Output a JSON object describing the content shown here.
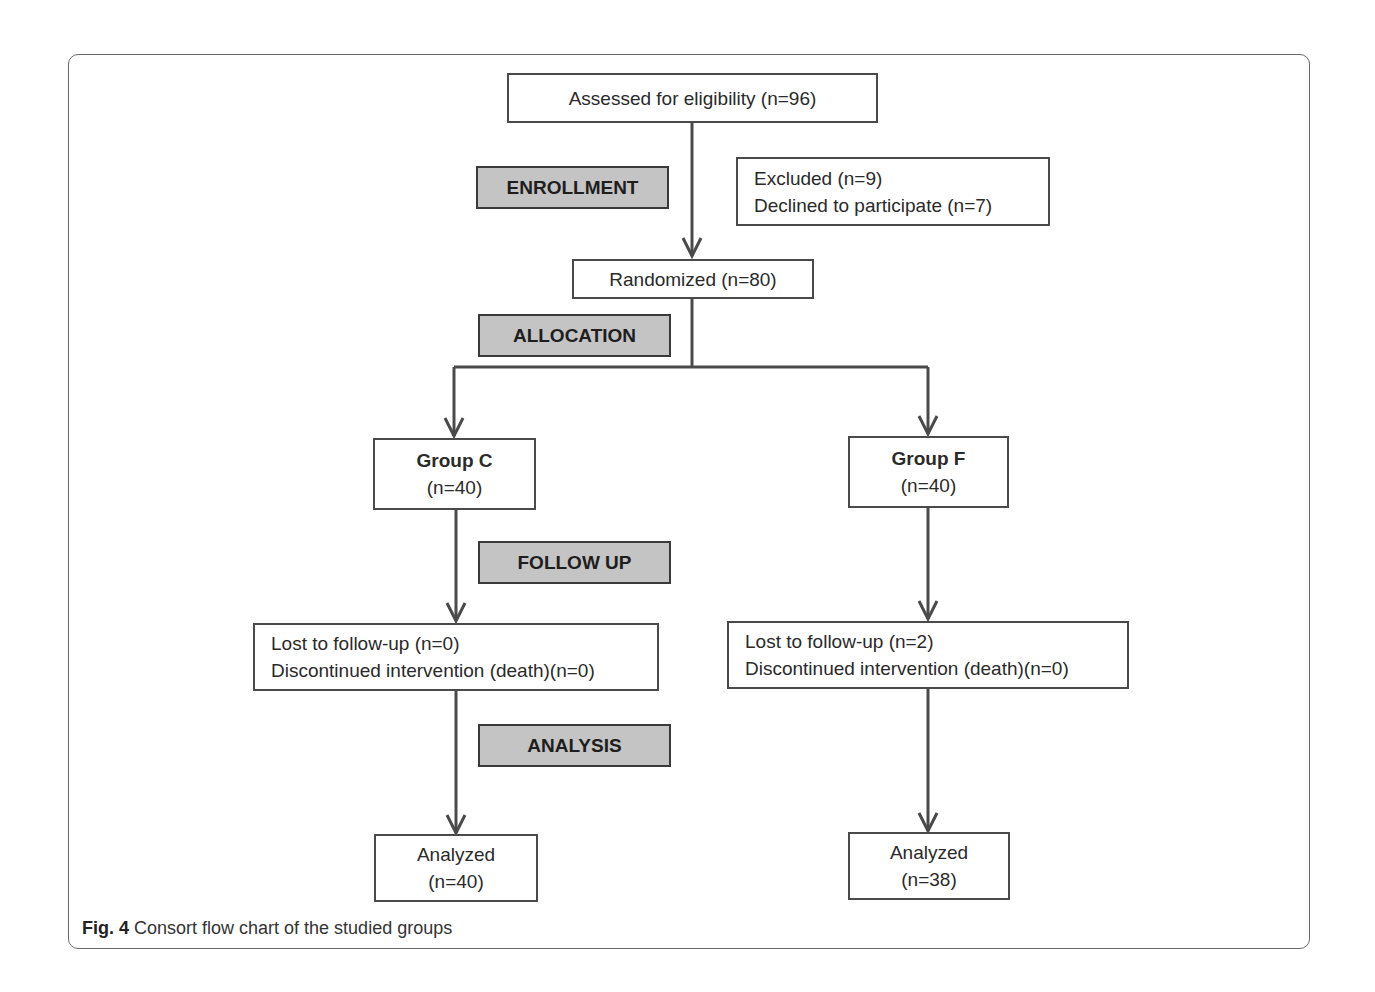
{
  "diagram": {
    "type": "CONSORT flow chart",
    "stages": {
      "enrollment": "ENROLLMENT",
      "allocation": "ALLOCATION",
      "follow_up": "FOLLOW UP",
      "analysis": "ANALYSIS"
    },
    "nodes": {
      "assessed": "Assessed for eligibility (n=96)",
      "excluded": {
        "line1": "Excluded (n=9)",
        "line2": "Declined to participate (n=7)"
      },
      "randomized": "Randomized (n=80)",
      "group_c": {
        "title": "Group C",
        "n": "(n=40)"
      },
      "group_f": {
        "title": "Group F",
        "n": "(n=40)"
      },
      "followup_c": {
        "line1": "Lost to follow-up (n=0)",
        "line2": "Discontinued intervention (death)(n=0)"
      },
      "followup_f": {
        "line1": "Lost to follow-up (n=2)",
        "line2": "Discontinued intervention (death)(n=0)"
      },
      "analyzed_c": {
        "title": "Analyzed",
        "n": "(n=40)"
      },
      "analyzed_f": {
        "title": "Analyzed",
        "n": "(n=38)"
      }
    },
    "edges": [
      [
        "assessed",
        "randomized"
      ],
      [
        "randomized",
        "group_c"
      ],
      [
        "randomized",
        "group_f"
      ],
      [
        "group_c",
        "followup_c"
      ],
      [
        "group_f",
        "followup_f"
      ],
      [
        "followup_c",
        "analyzed_c"
      ],
      [
        "followup_f",
        "analyzed_f"
      ]
    ]
  },
  "caption": {
    "label": "Fig. 4",
    "text": " Consort flow chart of the studied groups"
  }
}
